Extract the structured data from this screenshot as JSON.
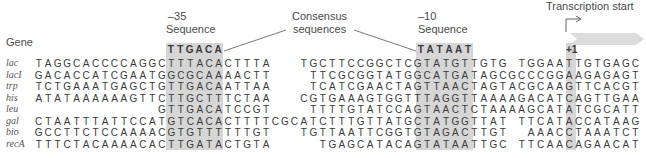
{
  "headers": {
    "gene": "Gene",
    "minus35_num": "–35",
    "minus35_label": "Sequence",
    "consensus_line1": "Consensus",
    "consensus_line2": "sequences",
    "minus10_num": "–10",
    "minus10_label": "Sequence",
    "transcription_start": "Transcription start",
    "plus1": "+1"
  },
  "consensus": {
    "minus35": "TTGACA",
    "minus10": "TATAAT"
  },
  "grid": {
    "columns": 64,
    "minus35_cols": [
      14,
      19
    ],
    "minus10_cols": [
      41,
      46
    ],
    "plus1_col": 54
  },
  "rows": [
    {
      "gene": "lac",
      "seq": "TAGGCACCCCAGGCTTTACACTTTA   TGCTTCCGGCTCGTATGTTGTG TGGAATTGTGAGC"
    },
    {
      "gene": "lacI",
      "seq": "GACACCATCGAATGGCGCAAAACTT    TTCGCGGTATGGCATGATAGCGCCCGGAAGAGAGT"
    },
    {
      "gene": "trp",
      "seq": "TCTGAAATGAGCTGTTGACAATTAA    TCATCGAACTAGTTAACTAGTACGCAAGTTCACGT"
    },
    {
      "gene": "his",
      "seq": "ATATAAAAAAGTTCTTGCTTTCTAA   CGTGAAAGTGGTTTAGGTTAAAAGACATCAGTTGAA"
    },
    {
      "gene": "leu",
      "seq": "             GTTGACATCCGT    TTTTGTATCCAGTAACTCTAAAAGCATATCGCATT"
    },
    {
      "gene": "gal",
      "seq": "CTAATTTATTCCATGTCACACTTTTCGCATCTTTGTTATGCTATGGTTAT TTCATACCATAAG"
    },
    {
      "gene": "bio",
      "seq": "GCCTTCTCCAAAACGTGTTTTTTGT   TGTTAATTCGGTGTAGACTTGT  AAACCTAAATCT"
    },
    {
      "gene": "recA",
      "seq": "TTTCTACAAAACACTTGATACTGTA     TGAGCATACAGTATAATTGC TTCAACAGAACAT"
    }
  ],
  "colors": {
    "shade": "#d6d6d6",
    "arrow": "#dcdcdc",
    "text": "#3a3a3a"
  }
}
